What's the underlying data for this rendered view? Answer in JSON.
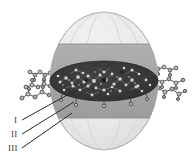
{
  "figure": {
    "type": "schematic-diagram",
    "background_color": "#ffffff"
  },
  "labels": [
    {
      "id": "label-I",
      "text": "I",
      "x": 14,
      "y": 123,
      "points_to": "inner-core",
      "leader_from": [
        22,
        120
      ],
      "leader_to": [
        78,
        89
      ]
    },
    {
      "id": "label-II",
      "text": "II",
      "x": 12,
      "y": 137,
      "points_to": "middle-shell",
      "leader_from": [
        22,
        134
      ],
      "leader_to": [
        74,
        102
      ]
    },
    {
      "id": "label-III",
      "text": "III",
      "x": 10,
      "y": 151,
      "points_to": "outer-shell",
      "leader_from": [
        22,
        148
      ],
      "leader_to": [
        72,
        113
      ]
    }
  ],
  "regions": [
    {
      "id": "outer-shell",
      "name": "outer-shell-region",
      "fill": "#e9e9e9",
      "stroke": "#9a9a9a",
      "description": "outermost translucent sphere"
    },
    {
      "id": "middle-shell",
      "name": "middle-shell-region",
      "fill": "#a8a8a8",
      "stroke": "#8a8a8a",
      "description": "mid-gray equatorial band"
    },
    {
      "id": "inner-core",
      "name": "inner-core-region",
      "fill": "#3a3a3a",
      "stroke": "#2a2a2a",
      "description": "dark dense core ellipse with molecular detail"
    }
  ],
  "sphere": {
    "center_x": 104,
    "center_y": 81,
    "radius_x": 54,
    "radius_y": 69,
    "band_top_y": 44,
    "band_bottom_y": 118,
    "core_ry": 20,
    "core_rx": 54
  },
  "ligands": {
    "name": "surface-ligand-chains",
    "color": "#5a5a5a",
    "node_fill": "#c8c8c8",
    "left_count": 3,
    "right_count": 3,
    "description": "ball-and-stick molecular chains protruding at the equator"
  },
  "colors": {
    "outer": "#e9e9e9",
    "middle": "#a8a8a8",
    "core": "#3a3a3a",
    "leader_line": "#2b2b2b",
    "label_text": "#3b3b3b",
    "speck_light": "#d8d8d8",
    "speck_mid": "#8e8e8e"
  }
}
